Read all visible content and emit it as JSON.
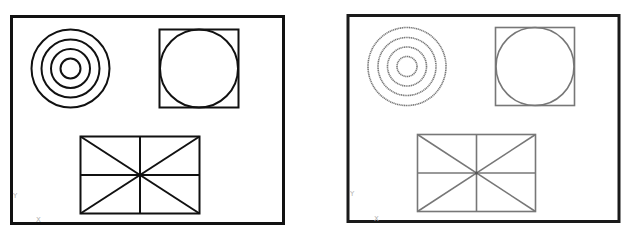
{
  "panels": [
    {
      "id": "left",
      "label": "original-drawing",
      "stroke_color": "#111111",
      "frame_color": "#111111",
      "axis_labels": {
        "y": "Y",
        "x": "X"
      },
      "shapes": [
        "concentric-circles",
        "square-with-inscribed-circle",
        "rectangle-with-cross-lines"
      ]
    },
    {
      "id": "right",
      "label": "plotted-drawing",
      "stroke_color": "#777777",
      "frame_color": "#1a1a1a",
      "axis_labels": {
        "y": "Y",
        "x": "X"
      },
      "shapes": [
        "concentric-circles",
        "square-with-inscribed-circle",
        "rectangle-with-cross-lines"
      ]
    }
  ]
}
